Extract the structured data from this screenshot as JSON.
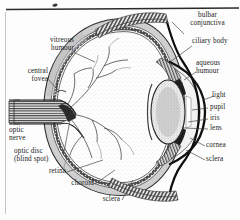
{
  "figure": {
    "kind": "anatomical-diagram",
    "colors": {
      "background": "#fdfdfd",
      "ink": "#1c1c1c",
      "rule": "#2a2a2a",
      "border": "#b8b8b8",
      "tissue_light": "#d9d9d9",
      "tissue_mid": "#8f8f8f",
      "tissue_dark": "#3a3a3a"
    }
  },
  "labels": {
    "vitreous_humour": "vitreous\nhumour",
    "central_fovea": "central\nfovea",
    "optic_nerve": "optic\nnerve",
    "optic_disc": "optic disc\n(blind spot)",
    "retina": "retina",
    "choroid": "choroid",
    "sclera_bottom": "sclera",
    "bulbar_conjunctiva": "bulbar\nconjunctiva",
    "ciliary_body": "ciliary body",
    "aqueous_humour": "aqueous\nhumour",
    "light": "light",
    "pupil": "pupil",
    "iris": "iris",
    "lens": "lens",
    "cornea": "cornea",
    "sclera_right": "sclera"
  },
  "parts": [
    "vitreous humour",
    "central fovea",
    "optic nerve",
    "optic disc (blind spot)",
    "retina",
    "choroid",
    "sclera",
    "bulbar conjunctiva",
    "ciliary body",
    "aqueous humour",
    "light",
    "pupil",
    "iris",
    "lens",
    "cornea"
  ]
}
